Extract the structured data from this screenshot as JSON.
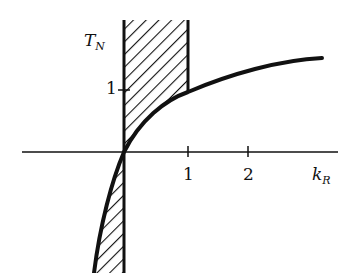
{
  "diagram": {
    "y_axis_label": "T",
    "y_axis_label_sub": "N",
    "x_axis_label": "k",
    "x_axis_label_sub": "R",
    "x_ticks": [
      "1",
      "2"
    ],
    "y_ticks": [
      "1"
    ],
    "colors": {
      "ink": "#111111",
      "background": "#ffffff"
    }
  }
}
